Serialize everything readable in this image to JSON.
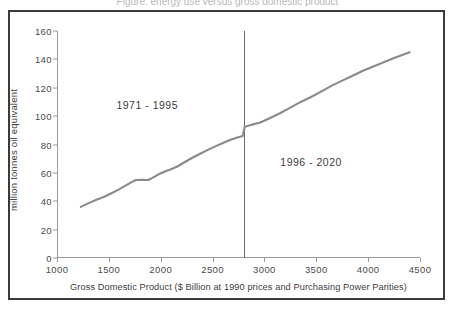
{
  "title_sliver": "Figure: energy use versus gross domestic product",
  "axes": {
    "ylabel": "million tonnes oil equivalent",
    "xlabel": "Gross Domestic Product ($ Billion at 1990 prices and Purchasing Power Parities)",
    "yticks": [
      0,
      20,
      40,
      60,
      80,
      100,
      120,
      140,
      160
    ],
    "xticks": [
      1000,
      1500,
      2000,
      2500,
      3000,
      3500,
      4000,
      4500
    ]
  },
  "annotations": [
    {
      "name": "period-historical",
      "text": "1971 - 1995",
      "x": 1870,
      "y": 108
    },
    {
      "name": "period-projected",
      "text": "1996 - 2020",
      "x": 3450,
      "y": 68
    }
  ],
  "colors": {
    "line": "#8a8a8a",
    "axis": "#9a9a9a",
    "divider": "#6a6a6a",
    "frame": "#3b3b3b",
    "text": "#3d3d3d",
    "background": "#ffffff"
  },
  "divider": {
    "name": "period-divider",
    "x": 2800
  },
  "chart_data": {
    "type": "line",
    "title": "",
    "xlabel": "Gross Domestic Product ($ Billion at 1990 prices and Purchasing Power Parities)",
    "ylabel": "million tonnes oil equivalent",
    "xlim": [
      1000,
      4500
    ],
    "ylim": [
      0,
      160
    ],
    "grid": false,
    "legend": null,
    "series": [
      {
        "name": "Energy consumption",
        "color": "#8a8a8a",
        "points": [
          [
            1230,
            36.0
          ],
          [
            1300,
            38.5
          ],
          [
            1380,
            41.0
          ],
          [
            1450,
            43.0
          ],
          [
            1520,
            45.5
          ],
          [
            1590,
            48.0
          ],
          [
            1660,
            51.0
          ],
          [
            1720,
            53.5
          ],
          [
            1760,
            55.0
          ],
          [
            1820,
            55.2
          ],
          [
            1880,
            55.0
          ],
          [
            1920,
            56.5
          ],
          [
            1980,
            59.0
          ],
          [
            2040,
            61.0
          ],
          [
            2100,
            62.5
          ],
          [
            2160,
            64.5
          ],
          [
            2230,
            67.5
          ],
          [
            2300,
            70.5
          ],
          [
            2380,
            73.5
          ],
          [
            2450,
            76.0
          ],
          [
            2520,
            78.5
          ],
          [
            2600,
            81.0
          ],
          [
            2680,
            83.5
          ],
          [
            2740,
            85.0
          ],
          [
            2790,
            86.0
          ],
          [
            2810,
            92.5
          ],
          [
            2880,
            94.0
          ],
          [
            2960,
            95.5
          ],
          [
            3050,
            98.5
          ],
          [
            3150,
            102.0
          ],
          [
            3250,
            106.0
          ],
          [
            3350,
            110.0
          ],
          [
            3450,
            113.5
          ],
          [
            3550,
            117.5
          ],
          [
            3650,
            121.5
          ],
          [
            3750,
            125.0
          ],
          [
            3850,
            128.5
          ],
          [
            3950,
            132.0
          ],
          [
            4050,
            135.0
          ],
          [
            4150,
            138.0
          ],
          [
            4250,
            141.0
          ],
          [
            4400,
            145.0
          ]
        ]
      }
    ]
  }
}
